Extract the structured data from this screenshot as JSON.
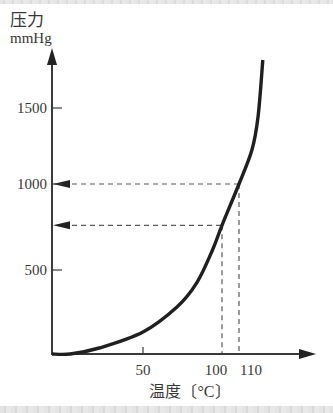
{
  "figure": {
    "y_axis_label_line1": "压力",
    "y_axis_label_line2": "mmHg",
    "x_axis_label": "温度〔°C〕"
  },
  "chart_data": {
    "type": "line",
    "title": "",
    "xlabel": "温度〔°C〕",
    "ylabel": "压力 mmHg",
    "x_ticks": [
      50,
      100,
      110
    ],
    "y_ticks": [
      500,
      1000,
      1500
    ],
    "xlim": [
      0,
      130
    ],
    "ylim": [
      0,
      1900
    ],
    "grid": false,
    "legend": null,
    "series": [
      {
        "name": "vapor pressure curve",
        "x": [
          0,
          10,
          26,
          50,
          71.5,
          84,
          94,
          100,
          110,
          117.6,
          121.2,
          124
        ],
        "y": [
          0,
          0,
          36,
          131,
          280,
          423,
          616,
          760,
          1000,
          1224,
          1441,
          1816
        ]
      }
    ],
    "annotations": [
      {
        "type": "dashed-guide",
        "x": 100,
        "y": 760,
        "arrow": "to-y-axis"
      },
      {
        "type": "dashed-guide",
        "x": 110,
        "y": 1000,
        "arrow": "to-y-axis"
      }
    ]
  },
  "colors": {
    "axis": "#3a3a3a",
    "curve": "#1f1f1f",
    "guide": "#5a5a5a",
    "text": "#383838"
  }
}
